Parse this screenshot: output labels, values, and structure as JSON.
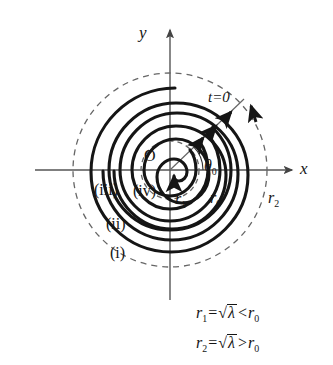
{
  "figure": {
    "type": "phase-portrait-spiral-diagram",
    "axes": {
      "x_label": "x",
      "y_label": "y",
      "origin_label": "O"
    },
    "annotations": {
      "initial_time": "t=0",
      "initial_angle": "θ",
      "initial_angle_sub": "0"
    },
    "radii": [
      {
        "id": "r1",
        "base": "r",
        "sub": "1",
        "kind": "inner-limit-cycle",
        "dashed": true
      },
      {
        "id": "r0",
        "base": "r",
        "sub": "0",
        "kind": "initial-radius",
        "dashed": false
      },
      {
        "id": "r2",
        "base": "r",
        "sub": "2",
        "kind": "outer-limit-cycle",
        "dashed": true
      }
    ],
    "curves": [
      {
        "label": "(i)",
        "id": "curve-i"
      },
      {
        "label": "(ii)",
        "id": "curve-ii"
      },
      {
        "label": "(iii)",
        "id": "curve-iii"
      },
      {
        "label": "(iv)",
        "id": "curve-iv"
      }
    ],
    "equations": [
      {
        "id": "eq-r1",
        "lhs_base": "r",
        "lhs_sub": "1",
        "equals": "=",
        "radical": "√",
        "radicand": "λ",
        "relation": "<",
        "rhs_base": "r",
        "rhs_sub": "0",
        "text": "r1 = √λ < r0"
      },
      {
        "id": "eq-r2",
        "lhs_base": "r",
        "lhs_sub": "2",
        "equals": "=",
        "radical": "√",
        "radicand": "λ",
        "relation": ">",
        "rhs_base": "r",
        "rhs_sub": "0",
        "text": "r2 = √λ > r0"
      }
    ],
    "colors": {
      "ink": "#151515",
      "axis": "#555555",
      "dashed": "#666666",
      "background": "#ffffff"
    }
  }
}
